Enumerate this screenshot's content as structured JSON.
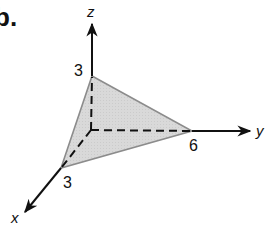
{
  "part_label": "b.",
  "figure": {
    "type": "3d-axes-plane-intercepts",
    "axes": {
      "x": {
        "name": "x",
        "intercept_label": "3"
      },
      "y": {
        "name": "y",
        "intercept_label": "6"
      },
      "z": {
        "name": "z",
        "intercept_label": "3"
      }
    },
    "plane": {
      "vertices": [
        "(3,0,0)",
        "(0,6,0)",
        "(0,0,3)"
      ],
      "fill_color": "#d8d8d8",
      "edge_color": "#8c8c8c"
    },
    "axis_color": "#111111"
  }
}
